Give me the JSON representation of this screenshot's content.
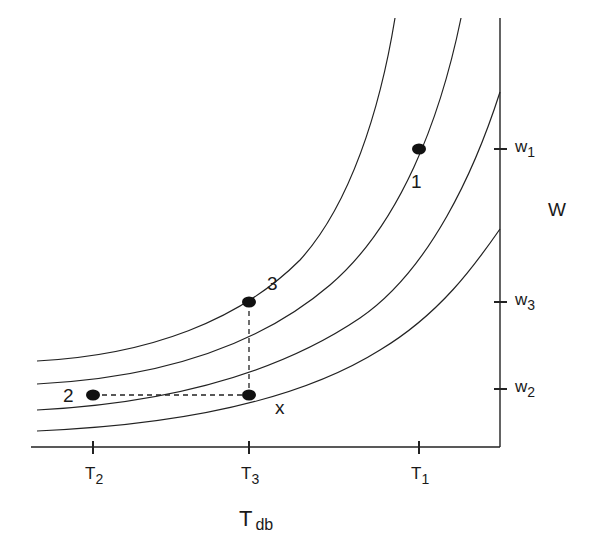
{
  "diagram": {
    "type": "psychrometric-process",
    "x_axis": {
      "label": "T",
      "label_sub": "db"
    },
    "y_axis": {
      "label": "W"
    },
    "x_ticks": [
      {
        "id": "T2",
        "label": "T",
        "sub": "2"
      },
      {
        "id": "T3",
        "label": "T",
        "sub": "3"
      },
      {
        "id": "T1",
        "label": "T",
        "sub": "1"
      }
    ],
    "y_ticks": [
      {
        "id": "w1",
        "label": "w",
        "sub": "1"
      },
      {
        "id": "w3",
        "label": "w",
        "sub": "3"
      },
      {
        "id": "w2",
        "label": "w",
        "sub": "2"
      }
    ],
    "points": [
      {
        "id": "1",
        "label": "1"
      },
      {
        "id": "2",
        "label": "2"
      },
      {
        "id": "3",
        "label": "3"
      },
      {
        "id": "x",
        "label": "x"
      }
    ],
    "curves_count": 4,
    "dashed_lines": [
      "2 to x (horizontal)",
      "x to 3 (vertical)"
    ]
  }
}
